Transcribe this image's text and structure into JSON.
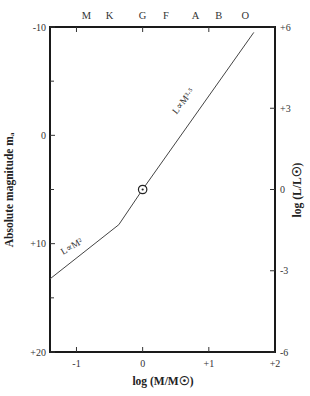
{
  "chart_data": {
    "type": "line",
    "title": "",
    "xlabel": "log (M/M☉)",
    "ylabel_left": "Absolute magnitude mₐ",
    "ylabel_right": "log (L/L☉)",
    "xlim": [
      -1.4,
      2
    ],
    "ylim_left": [
      20,
      -10
    ],
    "ylim_right": [
      -6,
      6
    ],
    "x_ticks": [
      {
        "value": -1,
        "label": "-1"
      },
      {
        "value": 0,
        "label": "0"
      },
      {
        "value": 1,
        "label": "+1"
      },
      {
        "value": 2,
        "label": "+2"
      }
    ],
    "left_ticks": [
      {
        "value": -10,
        "label": "-10"
      },
      {
        "value": 0,
        "label": "0"
      },
      {
        "value": 10,
        "label": "+10"
      },
      {
        "value": 20,
        "label": "+20"
      }
    ],
    "right_ticks": [
      {
        "value": 6,
        "label": "+6"
      },
      {
        "value": 3,
        "label": "+3"
      },
      {
        "value": 0,
        "label": "0"
      },
      {
        "value": -3,
        "label": "-3"
      },
      {
        "value": -6,
        "label": "-6"
      }
    ],
    "spectral_classes": [
      {
        "label": "M",
        "x": -0.85
      },
      {
        "label": "K",
        "x": -0.5
      },
      {
        "label": "G",
        "x": 0
      },
      {
        "label": "F",
        "x": 0.35
      },
      {
        "label": "A",
        "x": 0.8
      },
      {
        "label": "B",
        "x": 1.15
      },
      {
        "label": "O",
        "x": 1.55
      }
    ],
    "series": [
      {
        "name": "Mass-luminosity relation",
        "x": [
          -1.4,
          -0.36,
          0,
          1.68
        ],
        "log_L": [
          -3.3,
          -1.3,
          0,
          5.8
        ],
        "abs_mag": [
          13.5,
          8.4,
          5.0,
          -9.4
        ]
      }
    ],
    "annotations": [
      {
        "text": "L∝M²",
        "x": -1.05,
        "log_L": -2.2,
        "angle": -30
      },
      {
        "text": "L∝M³·⁵",
        "x": 0.65,
        "log_L": 3.2,
        "angle": -52
      }
    ],
    "sun_marker": {
      "x": 0,
      "log_L": 0,
      "symbol": "☉"
    },
    "grid": false,
    "legend": "none"
  }
}
